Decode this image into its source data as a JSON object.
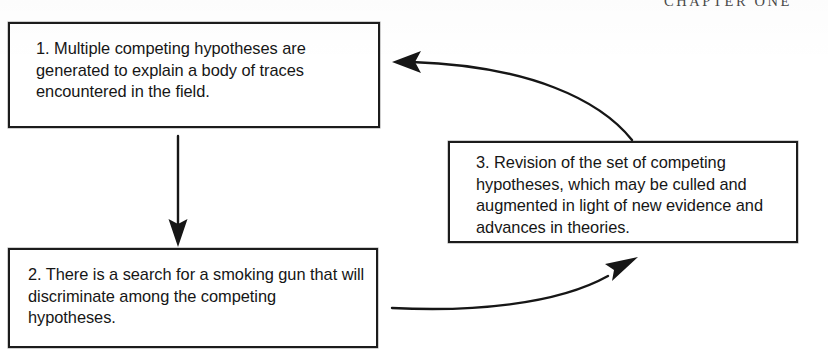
{
  "page": {
    "running_head": "CHAPTER ONE",
    "background_color": "#ffffff",
    "ink_color": "#161616"
  },
  "diagram": {
    "type": "cycle-flowchart",
    "title": "",
    "boxes": [
      {
        "id": "box-1",
        "number": "1.",
        "text": "1. Multiple competing hypotheses are generated to explain a body of traces encountered in the field."
      },
      {
        "id": "box-2",
        "number": "2.",
        "text": "2. There is a search for a smoking gun that will discriminate among the competing hypotheses."
      },
      {
        "id": "box-3",
        "number": "3.",
        "text": "3. Revision of the set of competing hypotheses, which may be culled and augmented in light of new evidence and advances in theories."
      }
    ],
    "arrows": [
      {
        "id": "arrow-1-to-2",
        "from": "box-1",
        "to": "box-2",
        "shape": "straight-vertical",
        "direction": "down"
      },
      {
        "id": "arrow-2-to-3",
        "from": "box-2",
        "to": "box-3",
        "shape": "curved",
        "direction": "up-right"
      },
      {
        "id": "arrow-3-to-1",
        "from": "box-3",
        "to": "box-1",
        "shape": "curved",
        "direction": "left"
      }
    ]
  }
}
